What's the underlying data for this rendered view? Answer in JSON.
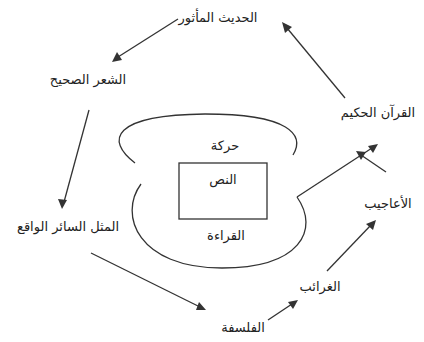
{
  "diagram": {
    "center": {
      "box_label": "النص",
      "top_label": "حركة",
      "bottom_label": "القراءة"
    },
    "nodes": [
      {
        "id": "hadith",
        "label": "الحديث المأثور"
      },
      {
        "id": "shiir",
        "label": "الشعر الصحيح"
      },
      {
        "id": "mathal",
        "label": "المثل السائر الواقع"
      },
      {
        "id": "falsafa",
        "label": "الفلسفة"
      },
      {
        "id": "gharaib",
        "label": "الغرائب"
      },
      {
        "id": "aajib",
        "label": "الأعاجيب"
      },
      {
        "id": "quran",
        "label": "القرآن الحكيم"
      }
    ],
    "edges": [
      {
        "from": "quran",
        "to": "hadith"
      },
      {
        "from": "hadith",
        "to": "shiir"
      },
      {
        "from": "shiir",
        "to": "mathal"
      },
      {
        "from": "mathal",
        "to": "falsafa"
      },
      {
        "from": "falsafa",
        "to": "gharaib"
      },
      {
        "from": "gharaib",
        "to": "aajib"
      },
      {
        "from": "aajib",
        "to": "quran"
      },
      {
        "from": "reading-loop",
        "to": "quran"
      }
    ],
    "stroke_color": "#333333"
  }
}
